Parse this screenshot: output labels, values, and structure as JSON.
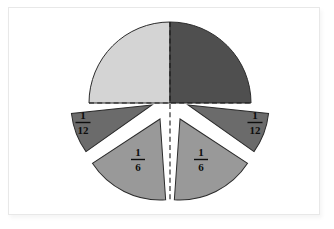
{
  "figure": {
    "background_color": "#ffffff",
    "frame_color": "#e8e8e8"
  },
  "palette": {
    "quarter_light": "#d4d4d4",
    "quarter_dark": "#4f4f4f",
    "twelfth": "#6b6b6b",
    "sixth": "#999999",
    "outline": "#2b2b2b",
    "dashed_guide": "#1a1a1a",
    "label_text": "#0d0d0d"
  },
  "circle": {
    "center_x": 170,
    "center_y": 103,
    "radius": 81
  },
  "pieces": [
    {
      "id": "quarter-top-left",
      "fraction_label": "",
      "numerator": 1,
      "denominator": 4,
      "color": "#d4d4d4",
      "start_angle_deg": 180,
      "end_angle_deg": 270,
      "exploded": false,
      "label_visible": false
    },
    {
      "id": "quarter-top-right",
      "fraction_label": "",
      "numerator": 1,
      "denominator": 4,
      "color": "#4f4f4f",
      "start_angle_deg": 270,
      "end_angle_deg": 360,
      "exploded": false,
      "label_visible": false
    },
    {
      "id": "twelfth-left",
      "fraction_label": "1/12",
      "numerator": "1",
      "denominator": "12",
      "color": "#6b6b6b",
      "start_angle_deg": 150,
      "end_angle_deg": 180,
      "exploded": true,
      "label_visible": true
    },
    {
      "id": "twelfth-right",
      "fraction_label": "1/12",
      "numerator": "1",
      "denominator": "12",
      "color": "#6b6b6b",
      "start_angle_deg": 0,
      "end_angle_deg": 30,
      "exploded": true,
      "label_visible": true
    },
    {
      "id": "sixth-left",
      "fraction_label": "1/6",
      "numerator": "1",
      "denominator": "6",
      "color": "#999999",
      "start_angle_deg": 90,
      "end_angle_deg": 150,
      "exploded": true,
      "label_visible": true
    },
    {
      "id": "sixth-right",
      "fraction_label": "1/6",
      "numerator": "1",
      "denominator": "6",
      "color": "#999999",
      "start_angle_deg": 30,
      "end_angle_deg": 90,
      "exploded": true,
      "label_visible": true
    }
  ],
  "labels": {
    "twelfth_left": {
      "numerator": "1",
      "denominator": "12"
    },
    "twelfth_right": {
      "numerator": "1",
      "denominator": "12"
    },
    "sixth_left": {
      "numerator": "1",
      "denominator": "6"
    },
    "sixth_right": {
      "numerator": "1",
      "denominator": "6"
    }
  },
  "guides": {
    "horizontal_dashed": {
      "visible": true,
      "y": 103,
      "x1": 89,
      "x2": 251
    },
    "vertical_dashed": {
      "visible": true,
      "x": 170,
      "y1": 22,
      "y2": 200
    }
  }
}
